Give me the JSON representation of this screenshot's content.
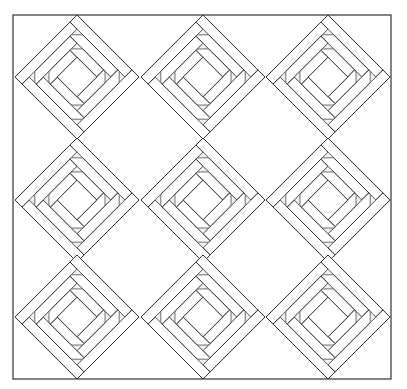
{
  "diagram": {
    "type": "quilt-pattern",
    "name": "Log Cabin blocks set on point",
    "caption_fragment": "",
    "border": {
      "x": 13,
      "y": 15,
      "width": 378,
      "height": 364,
      "stroke": "#333333"
    },
    "grid": {
      "rows": 3,
      "cols": 3,
      "centers_x": [
        77,
        203,
        328
      ],
      "centers_y": [
        77,
        200,
        317
      ],
      "half_diagonal": 62
    },
    "block": {
      "style": "log-cabin",
      "rotation_deg": 45,
      "center_half_side": 14,
      "ring_widths": [
        10,
        10,
        10
      ],
      "strip_stroke": "#2a2a2a",
      "strip_fill": "#ffffff",
      "corner_triangle_stroke": "#666666",
      "corner_triangle_fill": "#f2f2f2",
      "corner_triangle_size": 8
    }
  }
}
